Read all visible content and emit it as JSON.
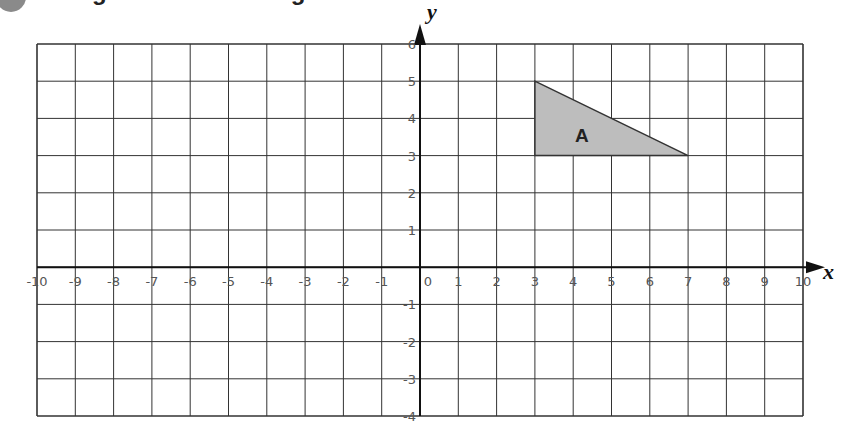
{
  "header": {
    "title_fragment": "Enlargement and enlarge"
  },
  "chart_data": {
    "type": "coordinate-grid",
    "xlabel": "x",
    "ylabel": "y",
    "xlim": [
      -10,
      10
    ],
    "ylim": [
      -4,
      6
    ],
    "grid": true,
    "x_ticks": [
      "-10",
      "-9",
      "-8",
      "-7",
      "-6",
      "-5",
      "-4",
      "-3",
      "-2",
      "-1",
      "0",
      "1",
      "2",
      "3",
      "4",
      "5",
      "6",
      "7",
      "8",
      "9",
      "10"
    ],
    "y_ticks": [
      "6",
      "5",
      "4",
      "3",
      "2",
      "1",
      "-1",
      "-2",
      "-3",
      "-4"
    ],
    "shapes": [
      {
        "label": "A",
        "type": "triangle",
        "vertices": [
          [
            3,
            5
          ],
          [
            3,
            3
          ],
          [
            7,
            3
          ]
        ],
        "fill": "#bdbdbd",
        "stroke": "#333333"
      }
    ]
  },
  "colors": {
    "grid": "#333333",
    "axis": "#111111",
    "shape_fill": "#bdbdbd",
    "tick_text": "#555555",
    "bullet": "#8a8a8a"
  }
}
